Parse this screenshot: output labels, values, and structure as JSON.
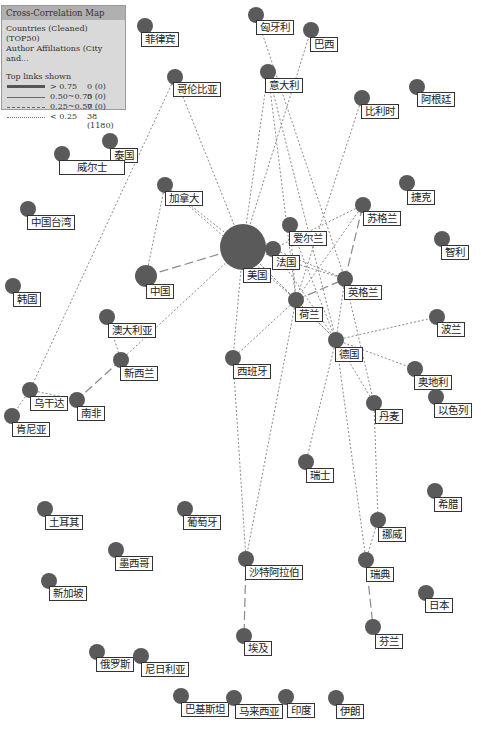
{
  "legend": {
    "title": "Cross-Correlation Map",
    "line1": "Countries (Cleaned) (TOP50)",
    "line2": "Author Affiliations (City and...",
    "links_title": "Top links shown",
    "rows": [
      {
        "range": "> 0.75",
        "count": "0 (0)",
        "style": "thick"
      },
      {
        "range": "0.50~0.75",
        "count": "0 (0)",
        "style": "solid"
      },
      {
        "range": "0.25~0.50",
        "count": "7 (0)",
        "style": "dashed"
      },
      {
        "range": "< 0.25",
        "count": "38 (1180)",
        "style": "dotted"
      }
    ]
  },
  "colors": {
    "node": "#5a5a5a",
    "edge": "#8a8a8a",
    "label_border": "#333333"
  },
  "nodes": [
    {
      "id": "philippines",
      "label": "菲律宾",
      "x": 145,
      "y": 26,
      "r": 8,
      "lx": 141,
      "ly": 32
    },
    {
      "id": "hungary",
      "label": "匈牙利",
      "x": 256,
      "y": 15,
      "r": 8,
      "lx": 256,
      "ly": 20
    },
    {
      "id": "brazil",
      "label": "巴西",
      "x": 311,
      "y": 30,
      "r": 8,
      "lx": 310,
      "ly": 37
    },
    {
      "id": "colombia",
      "label": "哥伦比亚",
      "x": 175,
      "y": 77,
      "r": 8,
      "lx": 173,
      "ly": 82
    },
    {
      "id": "italy",
      "label": "意大利",
      "x": 268,
      "y": 72,
      "r": 8,
      "lx": 265,
      "ly": 78
    },
    {
      "id": "belgium",
      "label": "比利时",
      "x": 362,
      "y": 98,
      "r": 8,
      "lx": 361,
      "ly": 104
    },
    {
      "id": "argentina",
      "label": "阿根廷",
      "x": 417,
      "y": 87,
      "r": 8,
      "lx": 417,
      "ly": 92
    },
    {
      "id": "thailand",
      "label": "泰国",
      "x": 110,
      "y": 141,
      "r": 8,
      "lx": 110,
      "ly": 148
    },
    {
      "id": "wales",
      "label": "威尔士",
      "x": 62,
      "y": 154,
      "r": 8,
      "lx": 59,
      "ly": 160,
      "w": 58
    },
    {
      "id": "canada",
      "label": "加拿大",
      "x": 165,
      "y": 185,
      "r": 8,
      "lx": 165,
      "ly": 191
    },
    {
      "id": "czech",
      "label": "捷克",
      "x": 407,
      "y": 183,
      "r": 8,
      "lx": 407,
      "ly": 190
    },
    {
      "id": "scotland",
      "label": "苏格兰",
      "x": 363,
      "y": 205,
      "r": 8,
      "lx": 363,
      "ly": 211
    },
    {
      "id": "taiwan",
      "label": "中国台湾",
      "x": 28,
      "y": 209,
      "r": 8,
      "lx": 27,
      "ly": 215
    },
    {
      "id": "chile",
      "label": "智利",
      "x": 442,
      "y": 239,
      "r": 8,
      "lx": 441,
      "ly": 245
    },
    {
      "id": "usa",
      "label": "美国",
      "x": 243,
      "y": 247,
      "r": 23,
      "lx": 243,
      "ly": 268
    },
    {
      "id": "ireland",
      "label": "爱尔兰",
      "x": 290,
      "y": 225,
      "r": 8,
      "lx": 289,
      "ly": 231
    },
    {
      "id": "france",
      "label": "法国",
      "x": 273,
      "y": 249,
      "r": 8,
      "lx": 272,
      "ly": 255
    },
    {
      "id": "china",
      "label": "中国",
      "x": 146,
      "y": 276,
      "r": 11,
      "lx": 146,
      "ly": 284
    },
    {
      "id": "korea",
      "label": "韩国",
      "x": 13,
      "y": 286,
      "r": 8,
      "lx": 13,
      "ly": 292
    },
    {
      "id": "england",
      "label": "英格兰",
      "x": 345,
      "y": 279,
      "r": 8,
      "lx": 344,
      "ly": 285
    },
    {
      "id": "netherlands",
      "label": "荷兰",
      "x": 296,
      "y": 300,
      "r": 8,
      "lx": 295,
      "ly": 307
    },
    {
      "id": "australia",
      "label": "澳大利亚",
      "x": 107,
      "y": 317,
      "r": 8,
      "lx": 108,
      "ly": 323
    },
    {
      "id": "poland",
      "label": "波兰",
      "x": 437,
      "y": 317,
      "r": 8,
      "lx": 437,
      "ly": 322
    },
    {
      "id": "germany",
      "label": "德国",
      "x": 336,
      "y": 340,
      "r": 8,
      "lx": 335,
      "ly": 347
    },
    {
      "id": "newzealand",
      "label": "新西兰",
      "x": 121,
      "y": 360,
      "r": 8,
      "lx": 120,
      "ly": 366
    },
    {
      "id": "spain",
      "label": "西班牙",
      "x": 233,
      "y": 358,
      "r": 8,
      "lx": 233,
      "ly": 364
    },
    {
      "id": "austria",
      "label": "奥地利",
      "x": 415,
      "y": 369,
      "r": 8,
      "lx": 414,
      "ly": 375
    },
    {
      "id": "uganda",
      "label": "乌干达",
      "x": 30,
      "y": 390,
      "r": 8,
      "lx": 30,
      "ly": 396
    },
    {
      "id": "southafrica",
      "label": "南非",
      "x": 77,
      "y": 400,
      "r": 8,
      "lx": 77,
      "ly": 406
    },
    {
      "id": "israel",
      "label": "以色列",
      "x": 436,
      "y": 397,
      "r": 8,
      "lx": 434,
      "ly": 403
    },
    {
      "id": "denmark",
      "label": "丹麦",
      "x": 374,
      "y": 403,
      "r": 8,
      "lx": 375,
      "ly": 409
    },
    {
      "id": "kenya",
      "label": "肯尼亚",
      "x": 12,
      "y": 416,
      "r": 8,
      "lx": 12,
      "ly": 422
    },
    {
      "id": "switzerland",
      "label": "瑞士",
      "x": 306,
      "y": 462,
      "r": 8,
      "lx": 306,
      "ly": 468
    },
    {
      "id": "greece",
      "label": "希腊",
      "x": 435,
      "y": 491,
      "r": 8,
      "lx": 434,
      "ly": 497
    },
    {
      "id": "turkey",
      "label": "土耳其",
      "x": 45,
      "y": 509,
      "r": 8,
      "lx": 45,
      "ly": 515
    },
    {
      "id": "portugal",
      "label": "葡萄牙",
      "x": 185,
      "y": 509,
      "r": 8,
      "lx": 183,
      "ly": 515
    },
    {
      "id": "norway",
      "label": "挪威",
      "x": 378,
      "y": 520,
      "r": 8,
      "lx": 378,
      "ly": 527
    },
    {
      "id": "mexico",
      "label": "墨西哥",
      "x": 116,
      "y": 550,
      "r": 8,
      "lx": 115,
      "ly": 556
    },
    {
      "id": "saudi",
      "label": "沙特阿拉伯",
      "x": 246,
      "y": 559,
      "r": 8,
      "lx": 245,
      "ly": 565
    },
    {
      "id": "sweden",
      "label": "瑞典",
      "x": 366,
      "y": 560,
      "r": 8,
      "lx": 366,
      "ly": 567
    },
    {
      "id": "singapore",
      "label": "新加坡",
      "x": 49,
      "y": 581,
      "r": 8,
      "lx": 49,
      "ly": 586
    },
    {
      "id": "japan",
      "label": "日本",
      "x": 426,
      "y": 593,
      "r": 8,
      "lx": 425,
      "ly": 598
    },
    {
      "id": "finland",
      "label": "芬兰",
      "x": 373,
      "y": 627,
      "r": 8,
      "lx": 375,
      "ly": 634
    },
    {
      "id": "egypt",
      "label": "埃及",
      "x": 244,
      "y": 636,
      "r": 8,
      "lx": 244,
      "ly": 641
    },
    {
      "id": "russia",
      "label": "俄罗斯",
      "x": 97,
      "y": 652,
      "r": 8,
      "lx": 96,
      "ly": 657
    },
    {
      "id": "nigeria",
      "label": "尼日利亚",
      "x": 141,
      "y": 656,
      "r": 8,
      "lx": 141,
      "ly": 662
    },
    {
      "id": "pakistan",
      "label": "巴基斯坦",
      "x": 181,
      "y": 696,
      "r": 8,
      "lx": 181,
      "ly": 702
    },
    {
      "id": "malaysia",
      "label": "马来西亚",
      "x": 234,
      "y": 698,
      "r": 8,
      "lx": 235,
      "ly": 704
    },
    {
      "id": "india",
      "label": "印度",
      "x": 286,
      "y": 697,
      "r": 8,
      "lx": 287,
      "ly": 703
    },
    {
      "id": "iran",
      "label": "伊朗",
      "x": 336,
      "y": 698,
      "r": 8,
      "lx": 336,
      "ly": 704
    }
  ],
  "edges": [
    [
      "usa",
      "china",
      "dashed"
    ],
    [
      "netherlands",
      "england",
      "dashed"
    ],
    [
      "newzealand",
      "southafrica",
      "dashed"
    ],
    [
      "saudi",
      "egypt",
      "dashed"
    ],
    [
      "sweden",
      "finland",
      "dashed"
    ],
    [
      "usa",
      "france",
      "dashed"
    ],
    [
      "england",
      "scotland",
      "dashed"
    ],
    [
      "usa",
      "colombia",
      "dotted"
    ],
    [
      "usa",
      "italy",
      "dotted"
    ],
    [
      "usa",
      "canada",
      "dotted"
    ],
    [
      "usa",
      "spain",
      "dotted"
    ],
    [
      "usa",
      "newzealand",
      "dotted"
    ],
    [
      "usa",
      "netherlands",
      "dotted"
    ],
    [
      "usa",
      "england",
      "dotted"
    ],
    [
      "usa",
      "germany",
      "dotted"
    ],
    [
      "usa",
      "brazil",
      "dotted"
    ],
    [
      "colombia",
      "uganda",
      "dotted"
    ],
    [
      "canada",
      "china",
      "dotted"
    ],
    [
      "canada",
      "netherlands",
      "dotted"
    ],
    [
      "italy",
      "germany",
      "dotted"
    ],
    [
      "italy",
      "netherlands",
      "dotted"
    ],
    [
      "hungary",
      "england",
      "dotted"
    ],
    [
      "belgium",
      "netherlands",
      "dotted"
    ],
    [
      "scotland",
      "netherlands",
      "dotted"
    ],
    [
      "scotland",
      "france",
      "dotted"
    ],
    [
      "france",
      "england",
      "dotted"
    ],
    [
      "france",
      "germany",
      "dotted"
    ],
    [
      "ireland",
      "netherlands",
      "dotted"
    ],
    [
      "ireland",
      "germany",
      "dotted"
    ],
    [
      "netherlands",
      "germany",
      "dotted"
    ],
    [
      "netherlands",
      "spain",
      "dotted"
    ],
    [
      "netherlands",
      "saudi",
      "dotted"
    ],
    [
      "england",
      "germany",
      "dotted"
    ],
    [
      "england",
      "denmark",
      "dotted"
    ],
    [
      "germany",
      "poland",
      "dotted"
    ],
    [
      "germany",
      "austria",
      "dotted"
    ],
    [
      "germany",
      "denmark",
      "dotted"
    ],
    [
      "germany",
      "switzerland",
      "dotted"
    ],
    [
      "germany",
      "sweden",
      "dotted"
    ],
    [
      "denmark",
      "norway",
      "dotted"
    ],
    [
      "norway",
      "sweden",
      "dotted"
    ],
    [
      "spain",
      "saudi",
      "dotted"
    ],
    [
      "australia",
      "newzealand",
      "dotted"
    ],
    [
      "uganda",
      "southafrica",
      "dotted"
    ],
    [
      "uganda",
      "kenya",
      "dotted"
    ]
  ]
}
